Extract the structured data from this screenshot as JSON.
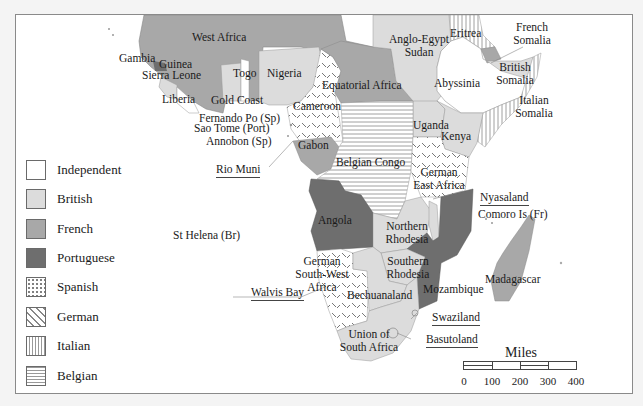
{
  "map": {
    "title_hidden": "",
    "regions": [
      {
        "name": "West Africa",
        "owner": "French"
      },
      {
        "name": "Gambia",
        "owner": "British"
      },
      {
        "name": "Guinea",
        "owner": "Portuguese"
      },
      {
        "name": "Sierra Leone",
        "owner": "British"
      },
      {
        "name": "Liberia",
        "owner": "Independent"
      },
      {
        "name": "Gold Coast",
        "owner": "British"
      },
      {
        "name": "Togo",
        "owner": "British"
      },
      {
        "name": "Nigeria",
        "owner": "British"
      },
      {
        "name": "Cameroon",
        "owner": "German"
      },
      {
        "name": "Equatorial Africa",
        "owner": "French"
      },
      {
        "name": "Anglo-Egypt Sudan",
        "owner": "British"
      },
      {
        "name": "Eritrea",
        "owner": "Italian"
      },
      {
        "name": "French Somalia",
        "owner": "French"
      },
      {
        "name": "Abyssinia",
        "owner": "Independent"
      },
      {
        "name": "British Somalia",
        "owner": "British"
      },
      {
        "name": "Italian Somalia",
        "owner": "Italian"
      },
      {
        "name": "Uganda",
        "owner": "British"
      },
      {
        "name": "Kenya",
        "owner": "British"
      },
      {
        "name": "Gabon",
        "owner": "French"
      },
      {
        "name": "Belgian Congo",
        "owner": "Belgian"
      },
      {
        "name": "German East Africa",
        "owner": "German"
      },
      {
        "name": "Angola",
        "owner": "Portuguese"
      },
      {
        "name": "Northern Rhodesia",
        "owner": "British"
      },
      {
        "name": "Southern Rhodesia",
        "owner": "British"
      },
      {
        "name": "Mozambique",
        "owner": "Portuguese"
      },
      {
        "name": "German South-West Africa",
        "owner": "German"
      },
      {
        "name": "Bechuanaland",
        "owner": "British"
      },
      {
        "name": "Union of South Africa",
        "owner": "British"
      },
      {
        "name": "Madagascar",
        "owner": "French"
      }
    ],
    "labels": {
      "west_africa": "West Africa",
      "gambia": "Gambia",
      "guinea": "Guinea",
      "sierra_leone": "Sierra Leone",
      "liberia": "Liberia",
      "gold_coast": "Gold Coast",
      "togo": "Togo",
      "nigeria": "Nigeria",
      "fernando_po": "Fernando Po (Sp)",
      "sao_tome": "Sao Tome (Port)",
      "annobon": "Annobon (Sp)",
      "cameroon": "Cameroon",
      "equatorial_africa": "Equatorial Africa",
      "sudan_1": "Anglo-Egypt",
      "sudan_2": "Sudan",
      "eritrea": "Eritrea",
      "french_somalia_1": "French",
      "french_somalia_2": "Somalia",
      "abyssinia": "Abyssinia",
      "british_somalia_1": "British",
      "british_somalia_2": "Somalia",
      "italian_somalia_1": "Italian",
      "italian_somalia_2": "Somalia",
      "uganda": "Uganda",
      "kenya": "Kenya",
      "gabon": "Gabon",
      "rio_muni": "Rio Muni",
      "belgian_congo": "Belgian Congo",
      "german_east_1": "German",
      "german_east_2": "East Africa",
      "nyasaland": "Nyasaland",
      "comoro": "Comoro Is (Fr)",
      "st_helena": "St Helena (Br)",
      "angola": "Angola",
      "n_rhodesia_1": "Northern",
      "n_rhodesia_2": "Rhodesia",
      "s_rhodesia_1": "Southern",
      "s_rhodesia_2": "Rhodesia",
      "gsw_1": "German",
      "gsw_2": "South-West",
      "gsw_3": "Africa",
      "walvis_bay": "Walvis Bay",
      "bechuanaland": "Bechuanaland",
      "mozambique": "Mozambique",
      "madagascar": "Madagascar",
      "swaziland": "Swaziland",
      "usa_1": "Union of",
      "usa_2": "South Africa",
      "basutoland": "Basutoland"
    }
  },
  "legend": {
    "items": [
      {
        "label": "Independent",
        "color": "#ffffff",
        "pattern": "none"
      },
      {
        "label": "British",
        "color": "#dcdcdc",
        "pattern": "none"
      },
      {
        "label": "French",
        "color": "#a8a8a8",
        "pattern": "none"
      },
      {
        "label": "Portuguese",
        "color": "#6e6e6e",
        "pattern": "none"
      },
      {
        "label": "Spanish",
        "color": "#ffffff",
        "pattern": "dots"
      },
      {
        "label": "German",
        "color": "#ffffff",
        "pattern": "dashes"
      },
      {
        "label": "Italian",
        "color": "#ffffff",
        "pattern": "vertical-lines"
      },
      {
        "label": "Belgian",
        "color": "#ffffff",
        "pattern": "horizontal-lines"
      }
    ]
  },
  "scale": {
    "title": "Miles",
    "ticks": [
      "0",
      "100",
      "200",
      "300",
      "400"
    ]
  }
}
